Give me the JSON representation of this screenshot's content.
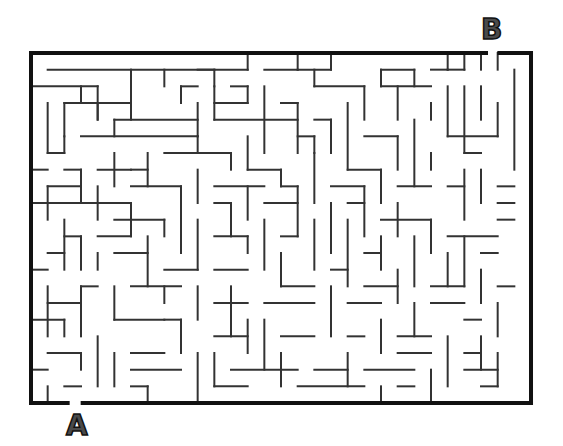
{
  "puzzle": {
    "type": "maze",
    "start_label": "A",
    "end_label": "B",
    "start_position": {
      "x": 66,
      "y": 412
    },
    "end_position": {
      "x": 481,
      "y": 16
    }
  },
  "grid": {
    "origin_x": 31,
    "origin_y": 53,
    "cols": 30,
    "rows": 21,
    "cell_w": 16.667,
    "cell_h": 16.667
  },
  "style": {
    "wall_color": "#333333",
    "border_color": "#111111",
    "wall_width": 2,
    "border_width": 4,
    "letter_color": "#4a4a4a"
  },
  "border": {
    "top": [
      [
        0,
        27.3
      ],
      [
        28.1,
        30
      ]
    ],
    "bottom": [
      [
        0,
        2.2
      ],
      [
        3.1,
        30
      ]
    ],
    "left": [
      [
        0,
        21
      ]
    ],
    "right": [
      [
        0,
        21
      ]
    ]
  },
  "walls": [
    [
      1,
      1,
      13,
      1
    ],
    [
      13,
      0,
      13,
      1
    ],
    [
      16,
      0,
      16,
      1
    ],
    [
      14,
      1,
      16,
      1
    ],
    [
      10,
      1,
      11,
      1
    ],
    [
      11,
      1,
      11,
      2
    ],
    [
      18,
      0,
      18,
      1
    ],
    [
      18,
      1,
      16,
      1
    ],
    [
      21,
      1,
      21,
      2
    ],
    [
      21,
      1,
      23,
      1
    ],
    [
      23,
      1,
      23,
      2
    ],
    [
      24,
      1,
      25,
      1
    ],
    [
      25,
      0,
      25,
      1
    ],
    [
      25,
      1,
      26,
      1
    ],
    [
      26,
      0,
      26,
      1
    ],
    [
      27,
      0,
      27,
      1
    ],
    [
      28,
      0,
      28,
      1
    ],
    [
      29,
      1,
      29,
      7
    ],
    [
      0,
      2,
      4,
      2
    ],
    [
      4,
      2,
      4,
      4
    ],
    [
      3,
      2,
      3,
      3
    ],
    [
      6,
      1,
      6,
      3
    ],
    [
      8,
      1,
      8,
      2
    ],
    [
      9,
      2,
      9,
      3
    ],
    [
      9,
      2,
      10,
      2
    ],
    [
      2,
      3,
      6,
      3
    ],
    [
      2,
      3,
      2,
      5
    ],
    [
      1,
      3,
      1,
      6
    ],
    [
      4,
      3,
      4,
      4
    ],
    [
      6,
      3,
      6,
      4
    ],
    [
      10,
      3,
      10,
      5
    ],
    [
      11,
      2,
      11,
      4
    ],
    [
      12,
      2,
      13,
      2
    ],
    [
      13,
      2,
      13,
      3
    ],
    [
      13,
      3,
      11,
      3
    ],
    [
      14,
      2,
      14,
      6
    ],
    [
      17,
      1,
      17,
      2
    ],
    [
      17,
      2,
      20,
      2
    ],
    [
      20,
      2,
      20,
      4
    ],
    [
      21,
      2,
      24,
      2
    ],
    [
      22,
      2,
      22,
      4
    ],
    [
      24,
      3,
      24,
      4
    ],
    [
      25,
      2,
      25,
      5
    ],
    [
      26,
      2,
      26,
      6
    ],
    [
      27,
      2,
      27,
      4
    ],
    [
      25,
      5,
      28,
      5
    ],
    [
      28,
      3,
      28,
      5
    ],
    [
      26,
      6,
      27,
      6
    ],
    [
      5,
      4,
      10,
      4
    ],
    [
      5,
      4,
      5,
      5
    ],
    [
      3,
      5,
      10,
      5
    ],
    [
      10,
      5,
      10,
      6
    ],
    [
      2,
      5,
      2,
      6
    ],
    [
      1,
      6,
      2,
      6
    ],
    [
      11,
      4,
      16,
      4
    ],
    [
      15,
      3,
      16,
      3
    ],
    [
      16,
      3,
      16,
      6
    ],
    [
      16,
      5,
      17,
      5
    ],
    [
      17,
      5,
      17,
      6
    ],
    [
      18,
      4,
      18,
      6
    ],
    [
      18,
      4,
      17,
      4
    ],
    [
      19,
      3,
      19,
      7
    ],
    [
      20,
      5,
      22,
      5
    ],
    [
      22,
      5,
      22,
      7
    ],
    [
      23,
      4,
      23,
      8
    ],
    [
      24,
      6,
      24,
      7
    ],
    [
      0,
      7,
      1,
      7
    ],
    [
      2,
      7,
      3,
      7
    ],
    [
      3,
      7,
      3,
      9
    ],
    [
      4,
      7,
      6,
      7
    ],
    [
      5,
      6,
      5,
      8
    ],
    [
      7,
      6,
      7,
      8
    ],
    [
      6,
      7,
      7,
      7
    ],
    [
      8,
      6,
      12,
      6
    ],
    [
      12,
      6,
      12,
      7
    ],
    [
      13,
      5,
      13,
      7
    ],
    [
      13,
      7,
      15,
      7
    ],
    [
      15,
      7,
      15,
      8
    ],
    [
      17,
      6,
      17,
      9
    ],
    [
      19,
      7,
      21,
      7
    ],
    [
      21,
      7,
      21,
      9
    ],
    [
      1,
      8,
      1,
      10
    ],
    [
      1,
      8,
      3,
      8
    ],
    [
      4,
      8,
      4,
      10
    ],
    [
      6,
      8,
      9,
      8
    ],
    [
      9,
      8,
      9,
      10
    ],
    [
      10,
      7,
      10,
      9
    ],
    [
      11,
      8,
      14,
      8
    ],
    [
      13,
      8,
      13,
      10
    ],
    [
      15,
      8,
      16,
      8
    ],
    [
      16,
      8,
      16,
      11
    ],
    [
      18,
      8,
      20,
      8
    ],
    [
      20,
      8,
      20,
      11
    ],
    [
      22,
      8,
      24,
      8
    ],
    [
      26,
      7,
      26,
      10
    ],
    [
      25,
      8,
      26,
      8
    ],
    [
      27,
      7,
      27,
      9
    ],
    [
      28,
      8,
      29,
      8
    ],
    [
      0,
      9,
      6,
      9
    ],
    [
      6,
      9,
      6,
      11
    ],
    [
      5,
      10,
      8,
      10
    ],
    [
      8,
      10,
      8,
      11
    ],
    [
      11,
      9,
      12,
      9
    ],
    [
      12,
      9,
      12,
      11
    ],
    [
      14,
      9,
      16,
      9
    ],
    [
      18,
      9,
      18,
      12
    ],
    [
      19,
      9,
      20,
      9
    ],
    [
      22,
      9,
      22,
      11
    ],
    [
      21,
      10,
      24,
      10
    ],
    [
      24,
      10,
      24,
      12
    ],
    [
      25,
      11,
      28,
      11
    ],
    [
      28,
      9,
      29,
      9
    ],
    [
      28,
      10,
      29,
      10
    ],
    [
      2,
      10,
      2,
      13
    ],
    [
      2,
      11,
      3,
      11
    ],
    [
      3,
      11,
      3,
      13
    ],
    [
      1,
      12,
      2,
      12
    ],
    [
      4,
      11,
      6,
      11
    ],
    [
      7,
      11,
      7,
      14
    ],
    [
      9,
      10,
      9,
      12
    ],
    [
      10,
      10,
      10,
      13
    ],
    [
      11,
      11,
      13,
      11
    ],
    [
      13,
      11,
      13,
      12
    ],
    [
      14,
      10,
      14,
      13
    ],
    [
      15,
      11,
      16,
      11
    ],
    [
      17,
      10,
      17,
      13
    ],
    [
      19,
      10,
      19,
      14
    ],
    [
      21,
      11,
      21,
      13
    ],
    [
      20,
      12,
      21,
      12
    ],
    [
      23,
      11,
      23,
      14
    ],
    [
      25,
      12,
      25,
      14
    ],
    [
      26,
      11,
      26,
      14
    ],
    [
      27,
      12,
      28,
      12
    ],
    [
      0,
      13,
      1,
      13
    ],
    [
      3,
      14,
      4,
      14
    ],
    [
      4,
      12,
      4,
      13
    ],
    [
      5,
      12,
      7,
      12
    ],
    [
      8,
      13,
      10,
      13
    ],
    [
      11,
      13,
      13,
      13
    ],
    [
      15,
      12,
      15,
      14
    ],
    [
      15,
      14,
      17,
      14
    ],
    [
      18,
      13,
      19,
      13
    ],
    [
      20,
      14,
      22,
      14
    ],
    [
      22,
      13,
      22,
      15
    ],
    [
      24,
      14,
      26,
      14
    ],
    [
      27,
      13,
      27,
      15
    ],
    [
      28,
      14,
      29,
      14
    ],
    [
      1,
      14,
      1,
      17
    ],
    [
      1,
      15,
      3,
      15
    ],
    [
      3,
      14,
      3,
      17
    ],
    [
      5,
      14,
      5,
      16
    ],
    [
      6,
      14,
      9,
      14
    ],
    [
      8,
      14,
      8,
      15
    ],
    [
      10,
      14,
      10,
      16
    ],
    [
      11,
      15,
      13,
      15
    ],
    [
      12,
      14,
      12,
      17
    ],
    [
      14,
      15,
      17,
      15
    ],
    [
      18,
      14,
      18,
      17
    ],
    [
      19,
      15,
      21,
      15
    ],
    [
      21,
      16,
      21,
      18
    ],
    [
      23,
      15,
      23,
      17
    ],
    [
      24,
      15,
      26,
      15
    ],
    [
      26,
      16,
      27,
      16
    ],
    [
      28,
      15,
      28,
      17
    ],
    [
      0,
      16,
      2,
      16
    ],
    [
      2,
      16,
      2,
      17
    ],
    [
      4,
      17,
      4,
      20
    ],
    [
      5,
      16,
      8,
      16
    ],
    [
      8,
      16,
      9,
      16
    ],
    [
      9,
      16,
      9,
      18
    ],
    [
      11,
      17,
      13,
      17
    ],
    [
      13,
      16,
      13,
      18
    ],
    [
      14,
      16,
      14,
      19
    ],
    [
      15,
      17,
      17,
      17
    ],
    [
      19,
      17,
      20,
      17
    ],
    [
      22,
      17,
      24,
      17
    ],
    [
      25,
      17,
      25,
      20
    ],
    [
      26,
      18,
      27,
      18
    ],
    [
      27,
      17,
      27,
      19
    ],
    [
      1,
      18,
      3,
      18
    ],
    [
      3,
      18,
      3,
      19
    ],
    [
      0,
      19,
      1,
      19
    ],
    [
      5,
      18,
      5,
      20
    ],
    [
      6,
      18,
      8,
      18
    ],
    [
      6,
      19,
      9,
      19
    ],
    [
      10,
      18,
      10,
      21
    ],
    [
      11,
      18,
      11,
      20
    ],
    [
      12,
      19,
      16,
      19
    ],
    [
      15,
      18,
      15,
      20
    ],
    [
      17,
      19,
      19,
      19
    ],
    [
      19,
      18,
      19,
      20
    ],
    [
      20,
      19,
      23,
      19
    ],
    [
      22,
      18,
      24,
      18
    ],
    [
      24,
      19,
      24,
      21
    ],
    [
      26,
      19,
      28,
      19
    ],
    [
      28,
      18,
      28,
      20
    ],
    [
      27,
      20,
      28,
      20
    ],
    [
      2,
      20,
      3,
      20
    ],
    [
      1,
      20,
      1,
      21
    ],
    [
      6,
      20,
      7,
      20
    ],
    [
      7,
      20,
      7,
      21
    ],
    [
      11,
      20,
      13,
      20
    ],
    [
      16,
      20,
      20,
      20
    ],
    [
      21,
      20,
      21,
      21
    ],
    [
      22,
      20,
      23,
      20
    ]
  ]
}
